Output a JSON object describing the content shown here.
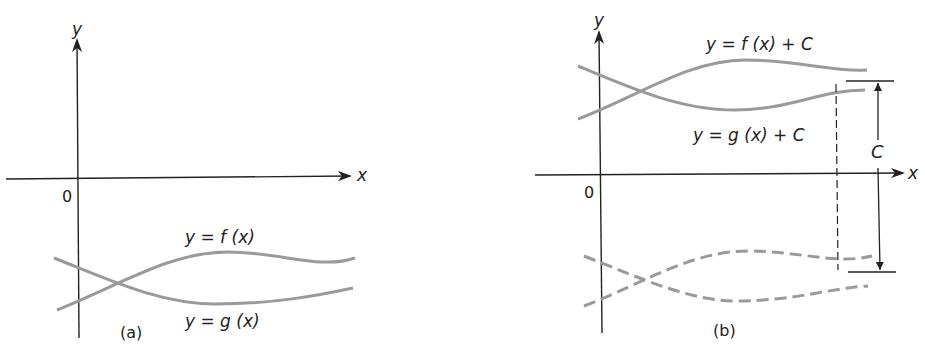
{
  "panels": [
    {
      "id": "a",
      "caption": "(a)",
      "axis_x": "x",
      "axis_y": "y",
      "origin": "0",
      "curve_f_label": "y = f (x)",
      "curve_g_label": "y = g (x)"
    },
    {
      "id": "b",
      "caption": "(b)",
      "axis_x": "x",
      "axis_y": "y",
      "origin": "0",
      "curve_f_label": "y = f (x) + C",
      "curve_g_label": "y = g (x) + C",
      "shift_label": "C"
    }
  ],
  "colors": {
    "axis": "#222222",
    "curve": "#9a9a9a"
  }
}
